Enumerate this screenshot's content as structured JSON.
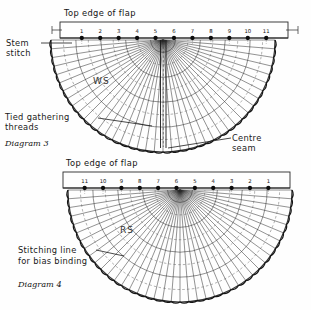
{
  "page": {
    "background_color": "#fefefe",
    "ink_color": "#141414",
    "width": 311,
    "height": 310
  },
  "diagram_top": {
    "caption": "Diagram 3",
    "title": "Top edge of flap",
    "side_label": "WS",
    "numbers": [
      "1",
      "2",
      "3",
      "4",
      "5",
      "6",
      "7",
      "8",
      "9",
      "10",
      "11"
    ],
    "annotations": {
      "stem_stitch": "Stem stitch",
      "stem_stitch_line1": "Stem",
      "stem_stitch_line2": "stitch",
      "tied_gathering_line1": "Tied gathering",
      "tied_gathering_line2": "threads",
      "centre_seam_line1": "Centre",
      "centre_seam_line2": "seam"
    },
    "geometry": {
      "apex_x": 163,
      "apex_y": 40,
      "band_left": 60,
      "band_right": 288,
      "band_top": 22,
      "band_bottom": 38,
      "radial_count": 41,
      "arc_count": 9,
      "outer_radius": 112
    }
  },
  "diagram_bottom": {
    "caption": "Diagram 4",
    "title": "Top edge of flap",
    "side_label": "RS",
    "numbers": [
      "11",
      "10",
      "9",
      "8",
      "7",
      "6",
      "5",
      "4",
      "3",
      "2",
      "1"
    ],
    "annotations": {
      "stitching_line1": "Stitching line",
      "stitching_line2": "for bias binding"
    },
    "geometry": {
      "apex_x": 180,
      "apex_y": 190,
      "band_left": 63,
      "band_right": 290,
      "band_top": 172,
      "band_bottom": 188,
      "radial_count": 41,
      "arc_count": 9,
      "outer_radius": 112
    }
  }
}
